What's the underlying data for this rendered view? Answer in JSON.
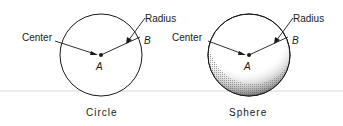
{
  "figures": [
    {
      "caption": "Circle",
      "labels": {
        "center": "Center",
        "radius": "Radius",
        "point_center": "A",
        "point_edge": "B"
      }
    },
    {
      "caption": "Sphere",
      "labels": {
        "center": "Center",
        "radius": "Radius",
        "point_center": "A",
        "point_edge": "B"
      }
    }
  ],
  "colors": {
    "stroke": "#1a1a1a",
    "ground_line": "#d8d8d8",
    "shade": "#555555"
  }
}
